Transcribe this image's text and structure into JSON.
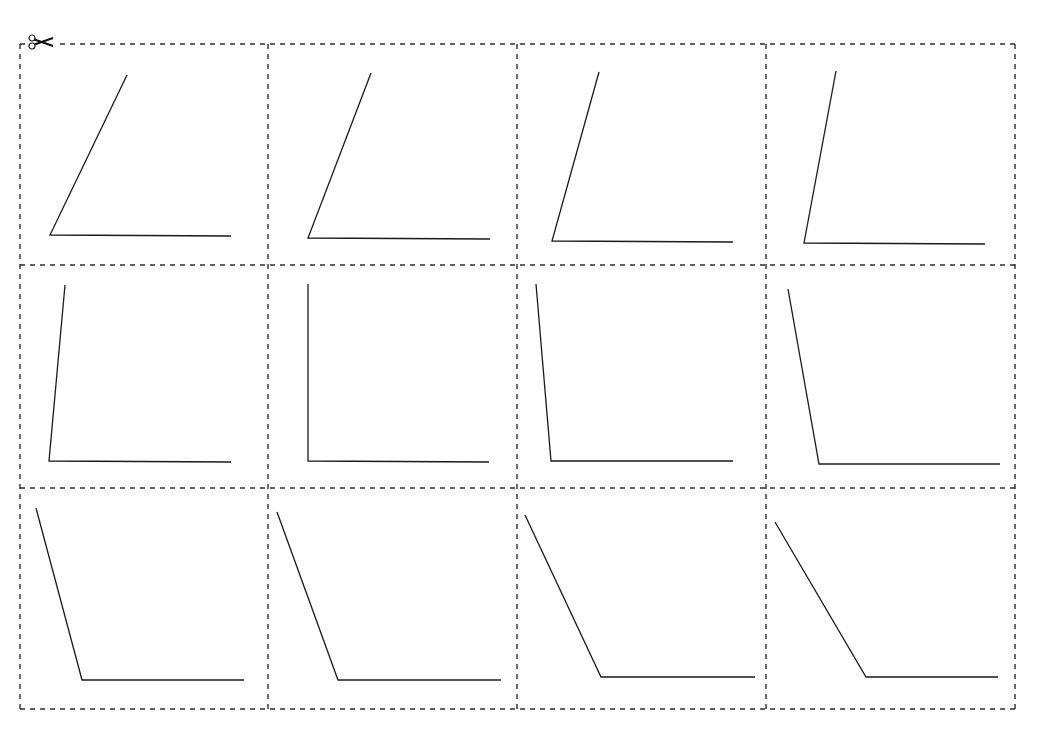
{
  "worksheet": {
    "type": "cut-out angle cards",
    "grid": {
      "rows": 3,
      "columns": 4
    },
    "frame": {
      "left": 20,
      "right": 1015,
      "top": 44,
      "bottom": 709
    },
    "column_dividers_x": [
      268,
      517,
      766
    ],
    "row_dividers_y": [
      265,
      488
    ],
    "cut_line_color": "#2e2e2e",
    "angle_line_color": "#1a1a1a",
    "scissors_icon": "scissors-icon",
    "cards": [
      {
        "row": 1,
        "col": 1,
        "arm_end": [
          127,
          75
        ],
        "vertex": [
          50,
          235
        ],
        "base_end": [
          231,
          236
        ],
        "approx_angle_deg": 62
      },
      {
        "row": 1,
        "col": 2,
        "arm_end": [
          371,
          73
        ],
        "vertex": [
          308,
          238
        ],
        "base_end": [
          490,
          239
        ],
        "approx_angle_deg": 69
      },
      {
        "row": 1,
        "col": 3,
        "arm_end": [
          599,
          72
        ],
        "vertex": [
          552,
          241
        ],
        "base_end": [
          733,
          242
        ],
        "approx_angle_deg": 74
      },
      {
        "row": 1,
        "col": 4,
        "arm_end": [
          836,
          71
        ],
        "vertex": [
          804,
          243
        ],
        "base_end": [
          985,
          244
        ],
        "approx_angle_deg": 80
      },
      {
        "row": 2,
        "col": 1,
        "arm_end": [
          65,
          285
        ],
        "vertex": [
          49,
          461
        ],
        "base_end": [
          231,
          462
        ],
        "approx_angle_deg": 85
      },
      {
        "row": 2,
        "col": 2,
        "arm_end": [
          308,
          284
        ],
        "vertex": [
          308,
          461
        ],
        "base_end": [
          489,
          462
        ],
        "approx_angle_deg": 90
      },
      {
        "row": 2,
        "col": 3,
        "arm_end": [
          536,
          284
        ],
        "vertex": [
          551,
          461
        ],
        "base_end": [
          733,
          461
        ],
        "approx_angle_deg": 95
      },
      {
        "row": 2,
        "col": 4,
        "arm_end": [
          788,
          289
        ],
        "vertex": [
          819,
          464
        ],
        "base_end": [
          1000,
          464
        ],
        "approx_angle_deg": 100
      },
      {
        "row": 3,
        "col": 1,
        "arm_end": [
          36,
          508
        ],
        "vertex": [
          82,
          680
        ],
        "base_end": [
          244,
          680
        ],
        "approx_angle_deg": 105
      },
      {
        "row": 3,
        "col": 2,
        "arm_end": [
          277,
          512
        ],
        "vertex": [
          338,
          680
        ],
        "base_end": [
          501,
          680
        ],
        "approx_angle_deg": 110
      },
      {
        "row": 3,
        "col": 3,
        "arm_end": [
          525,
          515
        ],
        "vertex": [
          601,
          677
        ],
        "base_end": [
          755,
          677
        ],
        "approx_angle_deg": 115
      },
      {
        "row": 3,
        "col": 4,
        "arm_end": [
          775,
          522
        ],
        "vertex": [
          866,
          677
        ],
        "base_end": [
          998,
          677
        ],
        "approx_angle_deg": 120
      }
    ]
  }
}
